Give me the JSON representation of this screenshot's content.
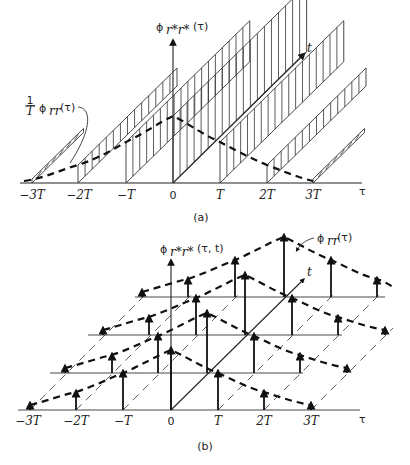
{
  "figure_a": {
    "caption": "(a)",
    "y_axis_label": "ϕr*r*(τ)",
    "y_axis_label_parts": {
      "phi": "ϕ",
      "sub": "r*r*",
      "arg": "(τ)"
    },
    "t_axis_label": "t",
    "x_axis_label": "τ",
    "envelope_label": {
      "frac_num": "1",
      "frac_den": "T",
      "phi": "ϕ",
      "sub": "rr",
      "arg": "(τ)"
    },
    "ticks": [
      "−3T",
      "−2T",
      "−T",
      "0",
      "T",
      "2T",
      "3T"
    ]
  },
  "figure_b": {
    "caption": "(b)",
    "y_axis_label": "ϕr*r*(τ, t)",
    "y_axis_label_parts": {
      "phi": "ϕ",
      "sub": "r*r*",
      "arg": "(τ, t)"
    },
    "t_axis_label": "t",
    "x_axis_label": "τ",
    "envelope_label": {
      "phi": "ϕ",
      "sub": "rr",
      "arg": "(τ)"
    },
    "ticks": [
      "−3T",
      "−2T",
      "−T",
      "0",
      "T",
      "2T",
      "3T"
    ]
  }
}
